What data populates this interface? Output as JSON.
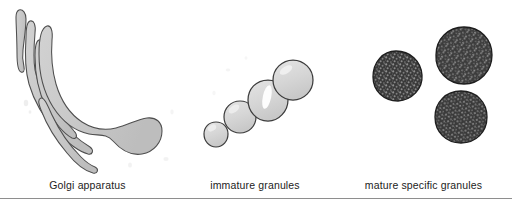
{
  "figure": {
    "type": "biological-diagram",
    "background_color": "#ffffff",
    "divider_color": "#8e8e8e",
    "panels": [
      {
        "id": "golgi",
        "caption": "Golgi apparatus",
        "structure": "stacked curved cisternae with terminal dilation",
        "element_count": 4,
        "fill_color": "#c9c9c9",
        "outline_color": "#4a4a4a",
        "highlight_color": "#e6e6e6"
      },
      {
        "id": "immature",
        "caption": "immature granules",
        "structure": "chain of four pale spheres increasing in diameter",
        "element_count": 4,
        "fill_color": "#d8d8d8",
        "outline_color": "#3c3c3c",
        "highlight_color": "#ffffff"
      },
      {
        "id": "mature",
        "caption": "mature specific granules",
        "structure": "three electron-dense stippled spheres",
        "element_count": 3,
        "fill_color": "#3a3a3a",
        "outline_color": "#1e1e1e",
        "speckle_color": "#8d8d8d"
      }
    ]
  },
  "captions": {
    "golgi": "Golgi apparatus",
    "immature": "immature granules",
    "mature": "mature specific granules"
  },
  "golgi_shapes": [
    {
      "name": "cisterna-1",
      "label": "outermost cisterna with terminal bulb"
    },
    {
      "name": "cisterna-2",
      "label": "second cisterna"
    },
    {
      "name": "cisterna-3",
      "label": "third cisterna"
    },
    {
      "name": "cisterna-4",
      "label": "innermost cisterna"
    }
  ],
  "immature_granules": [
    {
      "name": "granule-1",
      "size": "smallest",
      "cx": 216,
      "cy": 134,
      "r": 12
    },
    {
      "name": "granule-2",
      "size": "small",
      "cx": 240,
      "cy": 117,
      "r": 16
    },
    {
      "name": "granule-3",
      "size": "medium",
      "cx": 268,
      "cy": 100,
      "r": 20,
      "highlight": true
    },
    {
      "name": "granule-4",
      "size": "largest",
      "cx": 293,
      "cy": 80,
      "r": 20
    }
  ],
  "mature_granules": [
    {
      "name": "granule-left",
      "cx": 397,
      "cy": 76,
      "r": 25
    },
    {
      "name": "granule-top-right",
      "cx": 464,
      "cy": 55,
      "r": 29
    },
    {
      "name": "granule-bottom-right",
      "cx": 461,
      "cy": 117,
      "r": 26
    }
  ]
}
